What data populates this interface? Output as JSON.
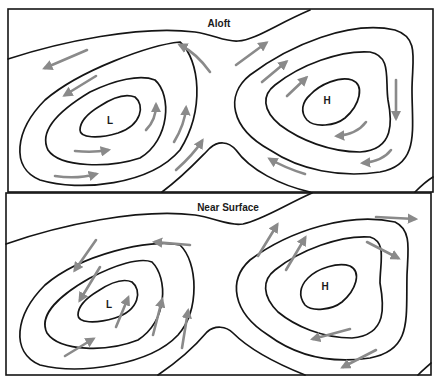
{
  "figure": {
    "colors": {
      "isobar": "#151515",
      "wind_arrow": "#8a8a8a",
      "background": "#ffffff"
    }
  },
  "panels": [
    {
      "id": "aloft",
      "title": "Aloft",
      "low_label": "L",
      "high_label": "H",
      "wind_behavior": "parallel to isobars"
    },
    {
      "id": "near-surface",
      "title": "Near Surface",
      "low_label": "L",
      "high_label": "H",
      "wind_behavior": "crosses isobars inward toward L, outward from H"
    }
  ]
}
